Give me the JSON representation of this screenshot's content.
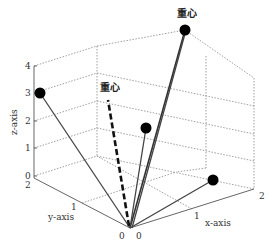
{
  "figure": {
    "type": "3d-vector-diagram",
    "axes": {
      "x": {
        "label": "x-axis",
        "ticks": [
          "0",
          "1",
          "2"
        ]
      },
      "y": {
        "label": "y-axis",
        "ticks": [
          "0",
          "1",
          "2"
        ]
      },
      "z": {
        "label": "z-axis",
        "ticks": [
          "0",
          "1",
          "2",
          "3",
          "4"
        ]
      }
    },
    "annotations": [
      {
        "id": "top",
        "text": "重心"
      },
      {
        "id": "dashed",
        "text": "重心"
      }
    ],
    "points": [
      {
        "name": "left",
        "description": "point at z=3 on y=2 plane"
      },
      {
        "name": "top",
        "description": "highest point labeled 重心"
      },
      {
        "name": "middle",
        "description": "mid point"
      },
      {
        "name": "right",
        "description": "point near x=2"
      }
    ],
    "colors": {
      "points": "#000000",
      "grid": "#777777",
      "axis": "#666666"
    }
  }
}
